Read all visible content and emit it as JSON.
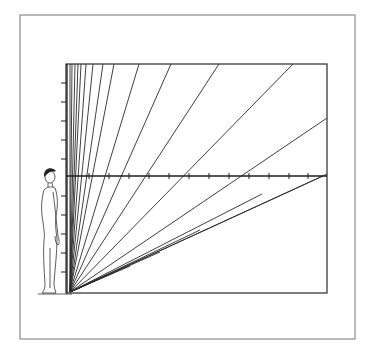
{
  "diagram": {
    "colors": {
      "background": "#ffffff",
      "frame": "#8a8a8a",
      "lines": "#2a2a2a"
    },
    "outer_frame": {
      "x": 20,
      "y": 15,
      "w": 335,
      "h": 324
    },
    "inner_box": {
      "x": 66,
      "y": 64,
      "w": 261,
      "h": 229
    },
    "origin": {
      "x": 70,
      "y": 292
    },
    "horizon_y": 176,
    "rays_to_top_x": [
      70,
      72,
      75,
      78,
      81,
      86,
      93,
      103,
      114,
      139,
      171,
      219,
      293
    ],
    "rays_to_right_y": [
      118,
      174
    ],
    "horizontal_ticks_x": [
      89,
      109,
      129,
      149,
      169,
      189,
      209,
      229,
      249,
      269,
      289,
      308
    ],
    "vertical_ticks_y": [
      83,
      102,
      121,
      140,
      159,
      196,
      215,
      234,
      253,
      272
    ],
    "figure": {
      "label": "standing-human-figure",
      "x": 36,
      "top_y": 167,
      "bottom_y": 293
    }
  }
}
